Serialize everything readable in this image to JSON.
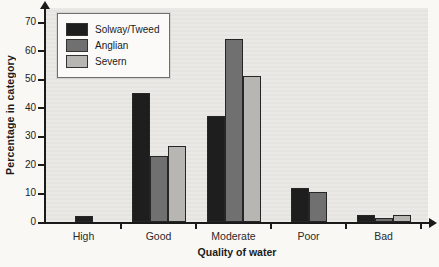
{
  "figure": {
    "background": "#f9f8f5",
    "plot_background": "#e8e7e3",
    "axis_color": "#1a1a1a"
  },
  "chart_data": {
    "type": "bar",
    "title": "",
    "xlabel": "Quality of water",
    "ylabel": "Percentage in category",
    "categories": [
      "High",
      "Good",
      "Moderate",
      "Poor",
      "Bad"
    ],
    "series": [
      {
        "name": "Solway/Tweed",
        "color": "#1e1e1e",
        "values": [
          2,
          45,
          37,
          12,
          2.5
        ]
      },
      {
        "name": "Anglian",
        "color": "#707070",
        "values": [
          0,
          23,
          64,
          10.5,
          1.5
        ]
      },
      {
        "name": "Severn",
        "color": "#b7b6b3",
        "values": [
          0,
          26.5,
          51,
          0,
          2.5
        ]
      }
    ],
    "ylim": [
      0,
      70
    ],
    "yticks": [
      0,
      10,
      20,
      30,
      40,
      50,
      60,
      70
    ],
    "grid": false,
    "legend_position": "top-left"
  }
}
